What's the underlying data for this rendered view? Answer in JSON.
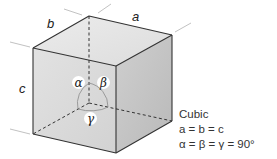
{
  "diagram": {
    "title": "Cubic",
    "edge_labels": {
      "a": "a",
      "b": "b",
      "c": "c"
    },
    "angle_labels": {
      "alpha": "α",
      "beta": "β",
      "gamma": "γ"
    },
    "relations": [
      "a = b = c",
      "α = β = γ = 90°"
    ],
    "colors": {
      "left_face": "#d9d9d9",
      "right_face": "#c4c4c4",
      "top_face": "#e8e8e8",
      "edge": "#333333",
      "guide": "#bdbdbd"
    }
  }
}
